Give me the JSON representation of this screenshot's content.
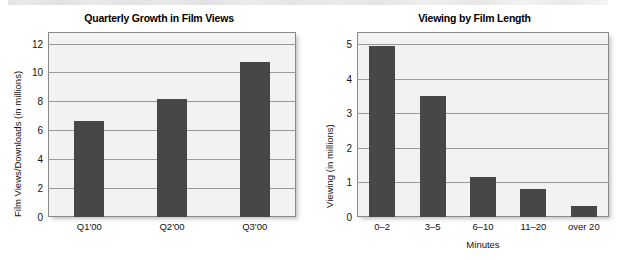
{
  "page": {
    "top_cut_text": "registration that on site removed arrangements, who on of been the on people programmes"
  },
  "colors": {
    "bar": "#474747",
    "plot_background": "#f2f2f2",
    "plot_border": "#8a8a8a",
    "gridline": "#9a9a9a",
    "text": "#111111"
  },
  "charts": [
    {
      "panel": "left",
      "chart_data": {
        "type": "bar",
        "title": "Quarterly Growth in Film Views",
        "xlabel": "",
        "ylabel": "Film Views/Downloads (in millions)",
        "categories": [
          "Q1'00",
          "Q2'00",
          "Q3'00"
        ],
        "values": [
          6.65,
          8.15,
          10.75
        ],
        "yticks": [
          "0",
          "2",
          "4",
          "6",
          "8",
          "10",
          "12"
        ],
        "ylim": [
          0,
          12.8
        ],
        "grid": true,
        "legend": "none"
      }
    },
    {
      "panel": "right",
      "chart_data": {
        "type": "bar",
        "title": "Viewing by Film Length",
        "xlabel": "Minutes",
        "ylabel": "Viewing (in millions)",
        "categories": [
          "0–2",
          "3–5",
          "6–10",
          "11–20",
          "over 20"
        ],
        "values": [
          4.95,
          3.5,
          1.15,
          0.8,
          0.33
        ],
        "yticks": [
          "0",
          "1",
          "2",
          "3",
          "4",
          "5"
        ],
        "ylim": [
          0,
          5.35
        ],
        "grid": true,
        "legend": "none"
      }
    }
  ]
}
